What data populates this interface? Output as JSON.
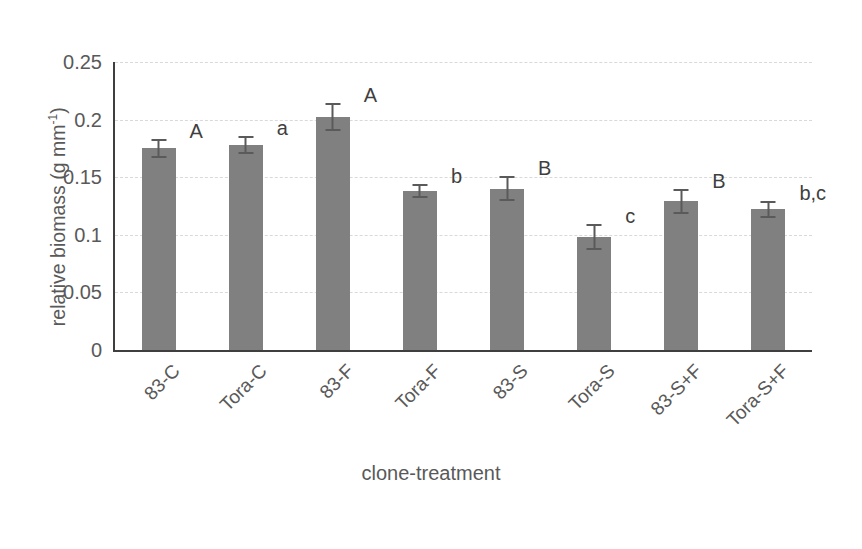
{
  "chart_data": {
    "type": "bar",
    "title": "",
    "xlabel": "clone-treatment",
    "ylabel": "relative biomass (g mm⁻¹)",
    "ylabel_parts": {
      "main": "relative biomass (g mm",
      "sup": "-1",
      "tail": ")"
    },
    "categories": [
      "83-C",
      "Tora-C",
      "83-F",
      "Tora-F",
      "83-S",
      "Tora-S",
      "83-S+F",
      "Tora-S+F"
    ],
    "values": [
      0.175,
      0.178,
      0.202,
      0.138,
      0.14,
      0.098,
      0.129,
      0.122
    ],
    "errors": [
      0.008,
      0.008,
      0.012,
      0.006,
      0.011,
      0.011,
      0.011,
      0.007
    ],
    "annotations": [
      "A",
      "a",
      "A",
      "b",
      "B",
      "c",
      "B",
      "b,c"
    ],
    "ylim": [
      0,
      0.25
    ],
    "yticks": [
      0,
      0.05,
      0.1,
      0.15,
      0.2,
      0.25
    ],
    "ytick_labels": [
      "0",
      "0.05",
      "0.1",
      "0.15",
      "0.2",
      "0.25"
    ],
    "grid": true,
    "legend": "none",
    "bar_color": "#808080",
    "error_color": "#5a5a5a",
    "gridline_color": "#d9d9d9",
    "axis_color": "#3f3f3f",
    "text_color": "#595959"
  }
}
